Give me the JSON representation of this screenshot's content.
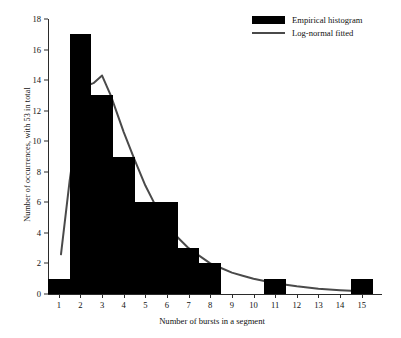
{
  "chart_data": {
    "type": "bar",
    "title": "",
    "xlabel": "Number of bursts in a segment",
    "ylabel": "Number of occurrences, with 53 in total",
    "xlim": [
      0.5,
      15.8
    ],
    "ylim": [
      0,
      18
    ],
    "ytick_labels": [
      "0",
      "2",
      "4",
      "6",
      "8",
      "10",
      "12",
      "14",
      "16",
      "18"
    ],
    "ytick_values": [
      0,
      2,
      4,
      6,
      8,
      10,
      12,
      14,
      16,
      18
    ],
    "xtick_labels": [
      "1",
      "2",
      "3",
      "4",
      "5",
      "6",
      "7",
      "8",
      "9",
      "10",
      "11",
      "12",
      "13",
      "14",
      "15"
    ],
    "categories": [
      1,
      2,
      3,
      4,
      5,
      6,
      7,
      8,
      9,
      10,
      11,
      12,
      13,
      14,
      15
    ],
    "values": [
      1,
      17,
      13,
      9,
      6,
      6,
      3,
      2,
      0,
      0,
      1,
      0,
      0,
      0,
      1
    ],
    "grid": false,
    "legend_position": "top-right",
    "series": [
      {
        "name": "Empirical histogram",
        "kind": "bar",
        "color": "#000000",
        "values": [
          1,
          17,
          13,
          9,
          6,
          6,
          3,
          2,
          0,
          0,
          1,
          0,
          0,
          0,
          1
        ]
      },
      {
        "name": "Log-normal fitted",
        "kind": "line",
        "color": "#4a4a4a",
        "x": [
          1.1,
          1.5,
          2.0,
          2.4,
          2.6,
          3.0,
          3.4,
          4.0,
          4.5,
          5.0,
          5.5,
          6.0,
          6.5,
          7.0,
          7.5,
          8.0,
          8.5,
          9.0,
          9.5,
          10.0,
          11.0,
          12.0,
          13.0,
          14.0,
          15.0
        ],
        "y": [
          2.6,
          7.4,
          12.4,
          13.7,
          13.8,
          14.3,
          13.0,
          10.6,
          8.8,
          7.1,
          5.7,
          4.6,
          3.7,
          3.0,
          2.5,
          2.0,
          1.7,
          1.4,
          1.2,
          1.0,
          0.7,
          0.5,
          0.35,
          0.25,
          0.18
        ]
      }
    ]
  },
  "legend": {
    "items": [
      {
        "label": "Empirical histogram",
        "marker": "filled-box"
      },
      {
        "label": "Log-normal fitted",
        "marker": "line"
      }
    ]
  }
}
